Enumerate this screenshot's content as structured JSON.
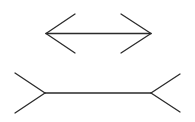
{
  "figure": {
    "title": "Müller-Lyer illusion",
    "stroke_color": "#2b2b2b",
    "background": "#ffffff",
    "stroke_width": 1.3
  },
  "top_figure": {
    "name": "arrow-in (arrowheads pointing outward)",
    "shaft": {
      "x1": 46,
      "y1": 33.5,
      "x2": 151,
      "y2": 33.5
    },
    "left_fins": [
      {
        "x1": 46,
        "y1": 33.5,
        "x2": 75,
        "y2": 14
      },
      {
        "x1": 46,
        "y1": 33.5,
        "x2": 75,
        "y2": 53
      }
    ],
    "right_fins": [
      {
        "x1": 151,
        "y1": 33.5,
        "x2": 121,
        "y2": 14
      },
      {
        "x1": 151,
        "y1": 33.5,
        "x2": 121,
        "y2": 53
      }
    ]
  },
  "bottom_figure": {
    "name": "fins-out (tails)",
    "shaft": {
      "x1": 45,
      "y1": 93,
      "x2": 151,
      "y2": 93
    },
    "left_fins": [
      {
        "x1": 45,
        "y1": 93,
        "x2": 15,
        "y2": 73
      },
      {
        "x1": 45,
        "y1": 93,
        "x2": 15,
        "y2": 113
      }
    ],
    "right_fins": [
      {
        "x1": 151,
        "y1": 93,
        "x2": 180,
        "y2": 74
      },
      {
        "x1": 151,
        "y1": 93,
        "x2": 180,
        "y2": 112
      }
    ]
  }
}
